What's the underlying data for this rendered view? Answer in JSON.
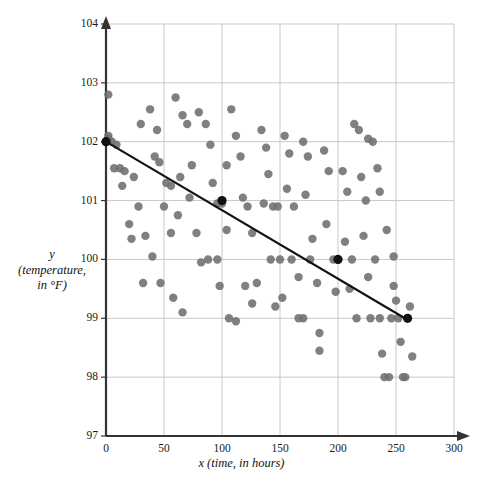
{
  "chart_data": {
    "type": "scatter",
    "title": "",
    "xlabel": "x (time, in hours)",
    "ylabel_line1": "y",
    "ylabel_line2": "(temperature,",
    "ylabel_line3": "in °F)",
    "xlim": [
      0,
      300
    ],
    "ylim": [
      97,
      104
    ],
    "xticks": [
      0,
      50,
      100,
      150,
      200,
      250,
      300
    ],
    "yticks": [
      97,
      98,
      99,
      100,
      101,
      102,
      103,
      104
    ],
    "xtick_labels": [
      "0",
      "50",
      "100",
      "150",
      "200",
      "250",
      "300"
    ],
    "ytick_labels": [
      "97",
      "98",
      "99",
      "100",
      "101",
      "102",
      "103",
      "104"
    ],
    "grid": true,
    "legend": "none",
    "point_color": "#6e6e6e",
    "line_color": "#111111",
    "grid_color": "#c8c8c8",
    "axis_color": "#333333",
    "points": [
      [
        2,
        102.8
      ],
      [
        2,
        102.1
      ],
      [
        2,
        102.05
      ],
      [
        5,
        102.0
      ],
      [
        9,
        101.95
      ],
      [
        7,
        101.55
      ],
      [
        12,
        101.55
      ],
      [
        16,
        101.5
      ],
      [
        24,
        101.4
      ],
      [
        14,
        101.25
      ],
      [
        20,
        100.6
      ],
      [
        22,
        100.35
      ],
      [
        32,
        99.6
      ],
      [
        47,
        99.6
      ],
      [
        30,
        102.3
      ],
      [
        38,
        102.55
      ],
      [
        44,
        102.2
      ],
      [
        42,
        101.75
      ],
      [
        52,
        101.3
      ],
      [
        56,
        100.45
      ],
      [
        60,
        102.75
      ],
      [
        66,
        102.45
      ],
      [
        70,
        102.3
      ],
      [
        74,
        101.6
      ],
      [
        62,
        100.75
      ],
      [
        58,
        99.35
      ],
      [
        66,
        99.1
      ],
      [
        80,
        102.5
      ],
      [
        86,
        102.3
      ],
      [
        90,
        101.95
      ],
      [
        92,
        101.3
      ],
      [
        96,
        100.95
      ],
      [
        100,
        100.95
      ],
      [
        104,
        101.6
      ],
      [
        104,
        100.5
      ],
      [
        98,
        99.55
      ],
      [
        108,
        102.55
      ],
      [
        112,
        102.1
      ],
      [
        116,
        101.75
      ],
      [
        118,
        101.05
      ],
      [
        122,
        100.9
      ],
      [
        126,
        100.45
      ],
      [
        130,
        99.6
      ],
      [
        134,
        102.2
      ],
      [
        138,
        101.9
      ],
      [
        140,
        101.45
      ],
      [
        136,
        100.95
      ],
      [
        144,
        100.9
      ],
      [
        148,
        100.9
      ],
      [
        142,
        100.0
      ],
      [
        150,
        100.0
      ],
      [
        154,
        102.1
      ],
      [
        158,
        101.8
      ],
      [
        156,
        101.2
      ],
      [
        162,
        100.9
      ],
      [
        160,
        100.0
      ],
      [
        166,
        99.7
      ],
      [
        170,
        102.0
      ],
      [
        174,
        101.75
      ],
      [
        172,
        101.1
      ],
      [
        178,
        100.35
      ],
      [
        176,
        100.0
      ],
      [
        182,
        99.6
      ],
      [
        184,
        98.75
      ],
      [
        184,
        98.45
      ],
      [
        188,
        101.85
      ],
      [
        192,
        101.5
      ],
      [
        190,
        100.6
      ],
      [
        196,
        100.0
      ],
      [
        198,
        99.45
      ],
      [
        200,
        100.0
      ],
      [
        204,
        101.5
      ],
      [
        208,
        101.15
      ],
      [
        206,
        100.3
      ],
      [
        212,
        100.0
      ],
      [
        210,
        99.5
      ],
      [
        216,
        99.0
      ],
      [
        220,
        101.4
      ],
      [
        224,
        101.0
      ],
      [
        222,
        100.4
      ],
      [
        226,
        99.7
      ],
      [
        228,
        99.0
      ],
      [
        232,
        100.0
      ],
      [
        236,
        99.0
      ],
      [
        238,
        98.4
      ],
      [
        240,
        98.0
      ],
      [
        244,
        98.0
      ],
      [
        246,
        99.0
      ],
      [
        248,
        99.55
      ],
      [
        250,
        99.3
      ],
      [
        252,
        99.0
      ],
      [
        254,
        98.6
      ],
      [
        256,
        98.0
      ],
      [
        258,
        98.0
      ],
      [
        262,
        99.2
      ],
      [
        264,
        98.35
      ],
      [
        248,
        100.05
      ],
      [
        242,
        100.5
      ],
      [
        236,
        101.15
      ],
      [
        234,
        101.55
      ],
      [
        230,
        102.0
      ],
      [
        226,
        102.05
      ],
      [
        218,
        102.2
      ],
      [
        214,
        102.3
      ],
      [
        170,
        99.0
      ],
      [
        166,
        99.0
      ],
      [
        152,
        99.35
      ],
      [
        146,
        99.2
      ],
      [
        126,
        99.25
      ],
      [
        120,
        99.55
      ],
      [
        112,
        98.95
      ],
      [
        106,
        99.0
      ],
      [
        96,
        100.0
      ],
      [
        88,
        100.0
      ],
      [
        82,
        99.95
      ],
      [
        78,
        100.45
      ],
      [
        72,
        101.05
      ],
      [
        64,
        101.4
      ],
      [
        56,
        101.25
      ],
      [
        50,
        100.9
      ],
      [
        46,
        101.65
      ],
      [
        40,
        100.05
      ],
      [
        34,
        100.4
      ],
      [
        28,
        100.9
      ]
    ],
    "trend_line": {
      "x_start": 0,
      "y_start": 102,
      "x_end": 262,
      "y_end": 98.95,
      "marked_points": [
        [
          0,
          102
        ],
        [
          100,
          101
        ],
        [
          200,
          100
        ],
        [
          260,
          99
        ]
      ]
    }
  }
}
